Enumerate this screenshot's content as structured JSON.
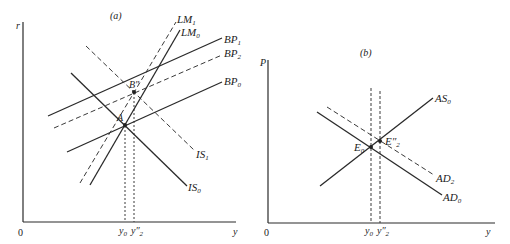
{
  "panel_a": {
    "title": "(a)",
    "y_axis_label": "r",
    "x_axis_label": "y",
    "origin_label": "0",
    "curves": {
      "LM1": {
        "name": "LM",
        "sub": "1",
        "style": "dashed"
      },
      "LM0": {
        "name": "LM",
        "sub": "0",
        "style": "solid"
      },
      "BP1": {
        "name": "BP",
        "sub": "1",
        "style": "solid"
      },
      "BP2": {
        "name": "BP",
        "sub": "2",
        "style": "dashed"
      },
      "BP0": {
        "name": "BP",
        "sub": "0",
        "style": "solid"
      },
      "IS1": {
        "name": "IS",
        "sub": "1",
        "style": "dashed"
      },
      "IS0": {
        "name": "IS",
        "sub": "0",
        "style": "solid"
      }
    },
    "points": {
      "A": "A",
      "B": "B″"
    },
    "x_ticks": {
      "y0": {
        "name": "y",
        "sub": "0"
      },
      "y2": {
        "name": "y″",
        "sub": "2"
      }
    }
  },
  "panel_b": {
    "title": "(b)",
    "y_axis_label": "P",
    "x_axis_label": "y",
    "origin_label": "0",
    "curves": {
      "AS0": {
        "name": "AS",
        "sub": "0",
        "style": "solid"
      },
      "AD2": {
        "name": "AD",
        "sub": "2",
        "style": "dashed"
      },
      "AD0": {
        "name": "AD",
        "sub": "0",
        "style": "solid"
      }
    },
    "points": {
      "E0": {
        "name": "E",
        "sub": "0"
      },
      "E2": {
        "name": "E″",
        "sub": "2"
      }
    },
    "x_ticks": {
      "y0": {
        "name": "y",
        "sub": "0"
      },
      "y2": {
        "name": "y″",
        "sub": "2"
      }
    }
  }
}
